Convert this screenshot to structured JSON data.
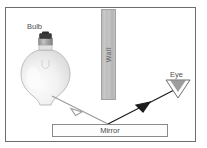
{
  "diagram": {
    "labels": {
      "bulb": "Bulb",
      "wall": "Wall",
      "mirror": "Mirror",
      "eye": "Eye"
    },
    "colors": {
      "frame": "#6d6d6d",
      "wall_fill": "#c0c0c0",
      "mirror_fill": "#fdfdfd",
      "incident_ray": "#9a9a9a",
      "reflected_ray": "#1c1c1c",
      "bulb_glass": "#efefef",
      "bulb_cap": "#3a3a3a",
      "text": "#4f4f4f"
    },
    "rays": [
      {
        "name": "incident-ray",
        "from": "bulb",
        "to": "mirror",
        "color": "#9a9a9a",
        "arrowhead": "mid"
      },
      {
        "name": "reflected-ray",
        "from": "mirror",
        "to": "eye",
        "color": "#1c1c1c",
        "arrowhead": "mid"
      }
    ],
    "objects": [
      {
        "name": "bulb",
        "label": "Bulb"
      },
      {
        "name": "wall",
        "label": "Wall"
      },
      {
        "name": "mirror",
        "label": "Mirror"
      },
      {
        "name": "eye",
        "label": "Eye"
      }
    ]
  }
}
